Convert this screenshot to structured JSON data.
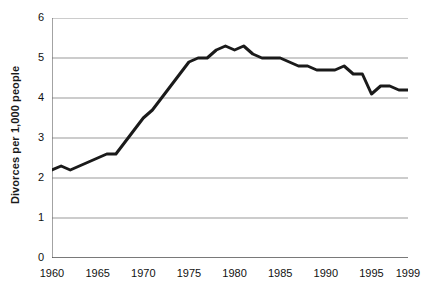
{
  "chart_data": {
    "type": "line",
    "title": "",
    "xlabel": "",
    "ylabel": "Divorces per 1,000 people",
    "xlim": [
      1960,
      1999
    ],
    "ylim": [
      0,
      6
    ],
    "yticks": [
      0,
      1,
      2,
      3,
      4,
      5,
      6
    ],
    "ytick_labels": [
      "0",
      "1",
      "2",
      "3",
      "4",
      "5",
      "6"
    ],
    "xtick_labels": [
      "1960",
      "1965",
      "1970",
      "1975",
      "1980",
      "1985",
      "1990",
      "1995",
      "1999"
    ],
    "xtick_values": [
      1960,
      1965,
      1970,
      1975,
      1980,
      1985,
      1990,
      1995,
      1999
    ],
    "minor_xticks_every": 1,
    "grid": "horizontal",
    "grid_color": "#999999",
    "legend": "none",
    "line_color": "#1a1a1a",
    "line_width": 3,
    "x": [
      1960,
      1961,
      1962,
      1963,
      1964,
      1965,
      1966,
      1967,
      1968,
      1969,
      1970,
      1971,
      1972,
      1973,
      1974,
      1975,
      1976,
      1977,
      1978,
      1979,
      1980,
      1981,
      1982,
      1983,
      1984,
      1985,
      1986,
      1987,
      1988,
      1989,
      1990,
      1991,
      1992,
      1993,
      1994,
      1995,
      1996,
      1997,
      1998,
      1999
    ],
    "values": [
      2.2,
      2.3,
      2.2,
      2.3,
      2.4,
      2.5,
      2.6,
      2.6,
      2.9,
      3.2,
      3.5,
      3.7,
      4.0,
      4.3,
      4.6,
      4.9,
      5.0,
      5.0,
      5.2,
      5.3,
      5.2,
      5.3,
      5.1,
      5.0,
      5.0,
      5.0,
      4.9,
      4.8,
      4.8,
      4.7,
      4.7,
      4.7,
      4.8,
      4.6,
      4.6,
      4.1,
      4.3,
      4.3,
      4.2,
      4.2
    ],
    "series_name": "Divorce rate"
  }
}
